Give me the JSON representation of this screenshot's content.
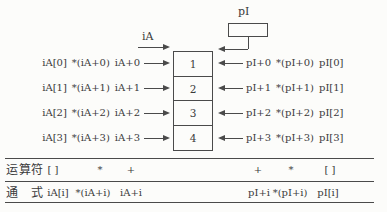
{
  "figure": {
    "pointer_label": "pI",
    "array_label": "iA",
    "rows": [
      {
        "index_form": "iA[0]",
        "deref_form": "*(iA+0)",
        "addr_form": "iA+0",
        "cell_value": "1",
        "ptr_addr": "pI+0",
        "ptr_deref": "*(pI+0)",
        "ptr_index": "pI[0]"
      },
      {
        "index_form": "iA[1]",
        "deref_form": "*(iA+1)",
        "addr_form": "iA+1",
        "cell_value": "2",
        "ptr_addr": "pI+1",
        "ptr_deref": "*(pI+1)",
        "ptr_index": "pI[1]"
      },
      {
        "index_form": "iA[2]",
        "deref_form": "*(iA+2)",
        "addr_form": "iA+2",
        "cell_value": "3",
        "ptr_addr": "pI+2",
        "ptr_deref": "*(pI+2)",
        "ptr_index": "pI[2]"
      },
      {
        "index_form": "iA[3]",
        "deref_form": "*(iA+3)",
        "addr_form": "iA+3",
        "cell_value": "4",
        "ptr_addr": "pI+3",
        "ptr_deref": "*(pI+3)",
        "ptr_index": "pI[3]"
      }
    ]
  },
  "table": {
    "operator_row_label": "运算符",
    "form_row_label": "通　式",
    "left_operators": [
      "[ ]",
      "*",
      "+"
    ],
    "right_operators": [
      "+",
      "*",
      "[ ]"
    ],
    "left_forms": [
      "iA[i]",
      "*(iA+i)",
      "iA+i"
    ],
    "right_forms": [
      "pI+i",
      "*(pI+i)",
      "pI[i]"
    ]
  },
  "colors": {
    "ink": "#3a3a3a",
    "line": "#4a4a4a",
    "background": "#fcfcfa"
  }
}
